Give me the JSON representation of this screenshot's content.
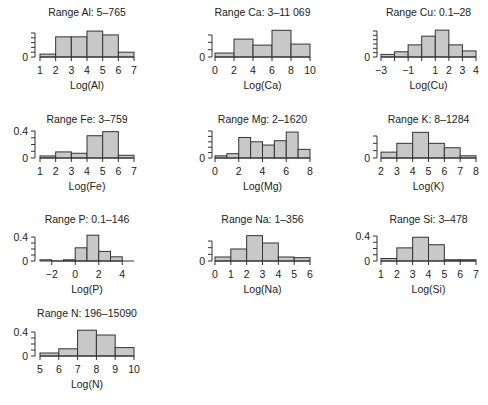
{
  "chart_data": [
    {
      "type": "bar",
      "element": "Al",
      "title": "Range Al: 5–765",
      "xlabel": "Log(Al)",
      "ylabel": "",
      "bin_edges": [
        1,
        2,
        3,
        4,
        5,
        6,
        7
      ],
      "values": [
        0.03,
        0.21,
        0.21,
        0.27,
        0.23,
        0.05
      ],
      "xlim": [
        1,
        7
      ],
      "ylim": [
        0,
        0.25
      ],
      "xticks": [
        1,
        2,
        3,
        4,
        5,
        6,
        7
      ],
      "xtick_labels": [
        "1",
        "2",
        "3",
        "4",
        "5",
        "6",
        "7"
      ],
      "yticks": [
        0,
        0.05,
        0.1,
        0.15,
        0.2,
        0.25
      ],
      "ytick_labels": [
        "0",
        "",
        "",
        "",
        "",
        ""
      ],
      "grid": false
    },
    {
      "type": "bar",
      "element": "Ca",
      "title": "Range Ca: 3–11 069",
      "xlabel": "Log(Ca)",
      "ylabel": "",
      "bin_edges": [
        0,
        2,
        4,
        6,
        8,
        10
      ],
      "values": [
        0.027,
        0.122,
        0.081,
        0.182,
        0.088
      ],
      "xlim": [
        0,
        10
      ],
      "ylim": [
        0,
        0.15
      ],
      "xticks": [
        0,
        2,
        4,
        6,
        8,
        10
      ],
      "xtick_labels": [
        "0",
        "2",
        "4",
        "6",
        "8",
        "10"
      ],
      "yticks": [
        0,
        0.05,
        0.1,
        0.15
      ],
      "ytick_labels": [
        "0",
        "",
        "",
        ""
      ],
      "grid": false
    },
    {
      "type": "bar",
      "element": "Cu",
      "title": "Range Cu: 0.1–28",
      "xlabel": "Log(Cu)",
      "ylabel": "",
      "bin_edges": [
        -3,
        -2,
        -1,
        0,
        1,
        2,
        3,
        4
      ],
      "values": [
        0.03,
        0.06,
        0.14,
        0.24,
        0.31,
        0.14,
        0.07
      ],
      "xlim": [
        -3,
        4
      ],
      "ylim": [
        0,
        0.3
      ],
      "xticks": [
        -3,
        -2,
        -1,
        0,
        1,
        2,
        3,
        4
      ],
      "xtick_labels": [
        "−3",
        "",
        "−1",
        "",
        "1",
        "2",
        "3",
        "4"
      ],
      "yticks": [
        0,
        0.05,
        0.1,
        0.15,
        0.2,
        0.25,
        0.3
      ],
      "ytick_labels": [
        "0",
        "",
        "",
        "",
        "",
        "",
        ""
      ],
      "grid": false
    },
    {
      "type": "bar",
      "element": "Fe",
      "title": "Range Fe: 3–759",
      "xlabel": "Log(Fe)",
      "ylabel": "",
      "bin_edges": [
        1,
        2,
        3,
        4,
        5,
        6,
        7
      ],
      "values": [
        0.03,
        0.09,
        0.07,
        0.33,
        0.39,
        0.04
      ],
      "xlim": [
        1,
        7
      ],
      "ylim": [
        0,
        0.4
      ],
      "xticks": [
        1,
        2,
        3,
        4,
        5,
        6,
        7
      ],
      "xtick_labels": [
        "1",
        "2",
        "3",
        "4",
        "5",
        "6",
        "7"
      ],
      "yticks": [
        0,
        0.1,
        0.2,
        0.3,
        0.4
      ],
      "ytick_labels": [
        "0",
        "",
        "",
        "",
        "0.4"
      ],
      "grid": false
    },
    {
      "type": "bar",
      "element": "Mg",
      "title": "Range Mg: 2–1620",
      "xlabel": "Log(Mg)",
      "ylabel": "",
      "bin_edges": [
        0,
        1,
        2,
        3,
        4,
        5,
        6,
        7,
        8
      ],
      "values": [
        0.02,
        0.04,
        0.19,
        0.15,
        0.12,
        0.16,
        0.24,
        0.08
      ],
      "xlim": [
        0,
        8
      ],
      "ylim": [
        0,
        0.25
      ],
      "xticks": [
        0,
        2,
        4,
        6,
        8
      ],
      "xtick_labels": [
        "0",
        "2",
        "4",
        "6",
        "8"
      ],
      "yticks": [
        0,
        0.05,
        0.1,
        0.15,
        0.2,
        0.25
      ],
      "ytick_labels": [
        "0",
        "",
        "",
        "",
        "",
        ""
      ],
      "grid": false
    },
    {
      "type": "bar",
      "element": "K",
      "title": "Range K: 8–1284",
      "xlabel": "Log(K)",
      "ylabel": "",
      "bin_edges": [
        2,
        3,
        4,
        5,
        6,
        7,
        8
      ],
      "values": [
        0.08,
        0.2,
        0.35,
        0.2,
        0.14,
        0.03
      ],
      "xlim": [
        2,
        8
      ],
      "ylim": [
        0,
        0.3
      ],
      "xticks": [
        2,
        3,
        4,
        5,
        6,
        7,
        8
      ],
      "xtick_labels": [
        "2",
        "3",
        "4",
        "5",
        "6",
        "7",
        "8"
      ],
      "yticks": [
        0,
        0.1,
        0.2,
        0.3
      ],
      "ytick_labels": [
        "0",
        "",
        "",
        ""
      ],
      "grid": false
    },
    {
      "type": "bar",
      "element": "P",
      "title": "Range P: 0.1–146",
      "xlabel": "Log(P)",
      "ylabel": "",
      "bin_edges": [
        -3,
        -2,
        -1,
        0,
        1,
        2,
        3,
        4,
        5
      ],
      "values": [
        0.02,
        0.0,
        0.02,
        0.22,
        0.43,
        0.16,
        0.07,
        0.0
      ],
      "xlim": [
        -3,
        5
      ],
      "ylim": [
        0,
        0.4
      ],
      "xticks": [
        -2,
        0,
        2,
        4
      ],
      "xtick_labels": [
        "−2",
        "0",
        "2",
        "4"
      ],
      "yticks": [
        0,
        0.1,
        0.2,
        0.3,
        0.4
      ],
      "ytick_labels": [
        "0",
        "",
        "",
        "",
        "0.4"
      ],
      "grid": false
    },
    {
      "type": "bar",
      "element": "Na",
      "title": "Range Na: 1–356",
      "xlabel": "Log(Na)",
      "ylabel": "",
      "bin_edges": [
        0,
        1,
        2,
        3,
        4,
        5,
        6
      ],
      "values": [
        0.06,
        0.18,
        0.38,
        0.27,
        0.06,
        0.05
      ],
      "xlim": [
        0,
        6
      ],
      "ylim": [
        0,
        0.3
      ],
      "xticks": [
        0,
        1,
        2,
        3,
        4,
        5,
        6
      ],
      "xtick_labels": [
        "0",
        "1",
        "2",
        "3",
        "4",
        "5",
        "6"
      ],
      "yticks": [
        0,
        0.1,
        0.2,
        0.3
      ],
      "ytick_labels": [
        "0",
        "",
        "",
        ""
      ],
      "grid": false
    },
    {
      "type": "bar",
      "element": "Si",
      "title": "Range Si: 3–478",
      "xlabel": "Log(Si)",
      "ylabel": "",
      "bin_edges": [
        1,
        2,
        3,
        4,
        5,
        6,
        7
      ],
      "values": [
        0.04,
        0.21,
        0.38,
        0.26,
        0.02,
        0.02
      ],
      "xlim": [
        1,
        7
      ],
      "ylim": [
        0,
        0.4
      ],
      "xticks": [
        1,
        2,
        3,
        4,
        5,
        6,
        7
      ],
      "xtick_labels": [
        "1",
        "2",
        "3",
        "4",
        "5",
        "6",
        "7"
      ],
      "yticks": [
        0,
        0.1,
        0.2,
        0.3,
        0.4
      ],
      "ytick_labels": [
        "0",
        "",
        "",
        "",
        "0.4"
      ],
      "grid": false
    },
    {
      "type": "bar",
      "element": "N",
      "title": "Range N: 196–15090",
      "xlabel": "Log(N)",
      "ylabel": "",
      "bin_edges": [
        5,
        6,
        7,
        8,
        9,
        10
      ],
      "values": [
        0.05,
        0.12,
        0.43,
        0.35,
        0.14
      ],
      "xlim": [
        5,
        10
      ],
      "ylim": [
        0,
        0.4
      ],
      "xticks": [
        5,
        6,
        7,
        8,
        9,
        10
      ],
      "xtick_labels": [
        "5",
        "6",
        "7",
        "8",
        "9",
        "10"
      ],
      "yticks": [
        0,
        0.1,
        0.2,
        0.3,
        0.4
      ],
      "ytick_labels": [
        "0",
        "",
        "",
        "",
        "0.4"
      ],
      "grid": false
    }
  ]
}
